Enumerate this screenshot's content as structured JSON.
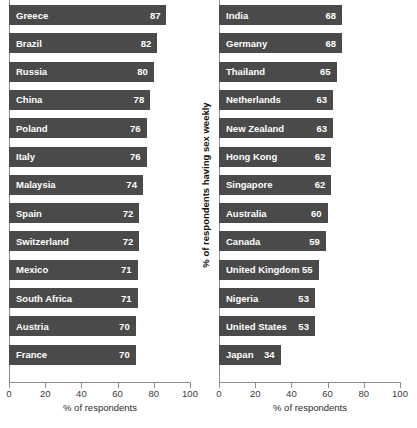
{
  "chart_data": {
    "type": "bar",
    "orientation": "horizontal",
    "title": "",
    "ylabel": "% of respondents having sex weekly",
    "xlabel": "% of respondents",
    "xlim": [
      0,
      100
    ],
    "xticks": [
      0,
      20,
      40,
      60,
      80,
      100
    ],
    "grid": false,
    "legend": null,
    "bar_color": "#4a4a4a",
    "label_color": "#ffffff",
    "axis_color": "#8d8d8d",
    "background": "#ffffff",
    "panels": [
      {
        "name": "left-panel",
        "xlabel": "% of respondents",
        "categories": [
          "Greece",
          "Brazil",
          "Russia",
          "China",
          "Poland",
          "Italy",
          "Malaysia",
          "Spain",
          "Switzerland",
          "Mexico",
          "South Africa",
          "Austria",
          "France"
        ],
        "values": [
          87,
          82,
          80,
          78,
          76,
          76,
          74,
          72,
          72,
          71,
          71,
          70,
          70
        ]
      },
      {
        "name": "right-panel",
        "xlabel": "% of respondents",
        "categories": [
          "India",
          "Germany",
          "Thailand",
          "Netherlands",
          "New Zealand",
          "Hong Kong",
          "Singapore",
          "Australia",
          "Canada",
          "United Kingdom",
          "Nigeria",
          "United States",
          "Japan"
        ],
        "values": [
          68,
          68,
          65,
          63,
          63,
          62,
          62,
          60,
          59,
          55,
          53,
          53,
          34
        ]
      }
    ]
  }
}
